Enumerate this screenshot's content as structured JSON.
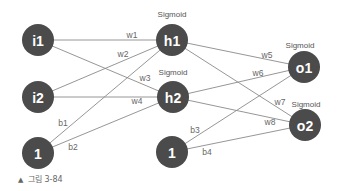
{
  "diagram": {
    "type": "neural-network",
    "node_color": "#4b4b4b",
    "edge_color": "#8a8a8a",
    "nodes": [
      {
        "id": "i1",
        "label": "i1",
        "x": 38,
        "y": 40,
        "r": 16
      },
      {
        "id": "i2",
        "label": "i2",
        "x": 38,
        "y": 97,
        "r": 16
      },
      {
        "id": "bias1",
        "label": "1",
        "x": 38,
        "y": 153,
        "r": 16
      },
      {
        "id": "h1",
        "label": "h1",
        "x": 172,
        "y": 40,
        "r": 16,
        "activation": "Sigmoid"
      },
      {
        "id": "h2",
        "label": "h2",
        "x": 173,
        "y": 97,
        "r": 16,
        "activation": "Sigmoid"
      },
      {
        "id": "bias2",
        "label": "1",
        "x": 172,
        "y": 152,
        "r": 16
      },
      {
        "id": "o1",
        "label": "o1",
        "x": 304,
        "y": 67,
        "r": 16,
        "activation": "Sigmoid"
      },
      {
        "id": "o2",
        "label": "o2",
        "x": 305,
        "y": 125,
        "r": 16,
        "activation": "Sigmoid"
      }
    ],
    "edges": [
      {
        "from": "i1",
        "to": "h1",
        "label": "w1",
        "lx": 132,
        "ly": 35
      },
      {
        "from": "i2",
        "to": "h1",
        "label": "w2",
        "lx": 123,
        "ly": 54
      },
      {
        "from": "i1",
        "to": "h2",
        "label": "w3",
        "lx": 145,
        "ly": 78
      },
      {
        "from": "i2",
        "to": "h2",
        "label": "w4",
        "lx": 137,
        "ly": 101
      },
      {
        "from": "bias1",
        "to": "h1",
        "label": "b1",
        "lx": 63,
        "ly": 123
      },
      {
        "from": "bias1",
        "to": "h2",
        "label": "b2",
        "lx": 73,
        "ly": 147
      },
      {
        "from": "h1",
        "to": "o1",
        "label": "w5",
        "lx": 267,
        "ly": 55
      },
      {
        "from": "h2",
        "to": "o1",
        "label": "w6",
        "lx": 258,
        "ly": 73
      },
      {
        "from": "h1",
        "to": "o2",
        "label": "w7",
        "lx": 280,
        "ly": 102
      },
      {
        "from": "h2",
        "to": "o2",
        "label": "w8",
        "lx": 270,
        "ly": 122
      },
      {
        "from": "bias2",
        "to": "o1",
        "label": "b3",
        "lx": 195,
        "ly": 130
      },
      {
        "from": "bias2",
        "to": "o2",
        "label": "b4",
        "lx": 207,
        "ly": 152
      }
    ],
    "activation_labels": [
      {
        "node": "h1",
        "text": "Sigmoid",
        "x": 172,
        "y": 14
      },
      {
        "node": "h2",
        "text": "Sigmoid",
        "x": 173,
        "y": 72
      },
      {
        "node": "o1",
        "text": "Sigmoid",
        "x": 300,
        "y": 45
      },
      {
        "node": "o2",
        "text": "Sigmoid",
        "x": 306,
        "y": 104
      }
    ]
  },
  "caption": {
    "marker": "▲",
    "text": "그림 3-84"
  }
}
